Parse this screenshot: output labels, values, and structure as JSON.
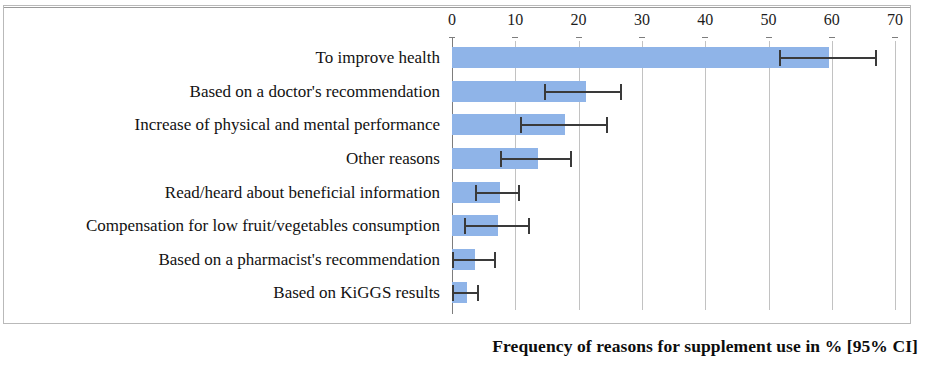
{
  "chart_data": {
    "type": "bar",
    "orientation": "horizontal",
    "title": "",
    "xlabel": "Frequency of reasons for supplement use in % [95% CI]",
    "ylabel": "",
    "xlim": [
      0,
      70
    ],
    "xticks": [
      0,
      10,
      20,
      30,
      40,
      50,
      60,
      70
    ],
    "xtick_labels": [
      "0",
      "10",
      "20",
      "30",
      "40",
      "50",
      "60",
      "70"
    ],
    "grid": "vertical",
    "legend": "none",
    "bar_color": "#8fb4e8",
    "error_bar_color": "#3a3a3a",
    "error_bar_type": "95% CI",
    "categories": [
      "To improve health",
      "Based on a doctor's recommendation",
      "Increase of physical and mental performance",
      "Other reasons",
      "Read/heard about beneficial information",
      "Compensation for low fruit/vegetables consumption",
      "Based on a pharmacist's recommendation",
      "Based on KiGGS results"
    ],
    "values": [
      59.6,
      21.1,
      17.9,
      13.6,
      7.6,
      7.3,
      3.7,
      2.3
    ],
    "ci_low": [
      51.7,
      14.6,
      10.8,
      7.6,
      3.7,
      1.9,
      0.0,
      0.0
    ],
    "ci_high": [
      67.2,
      26.9,
      24.7,
      18.9,
      10.8,
      12.3,
      7.0,
      4.2
    ]
  },
  "axis": {
    "title": "Frequency of reasons for supplement use in % [95% CI]"
  }
}
